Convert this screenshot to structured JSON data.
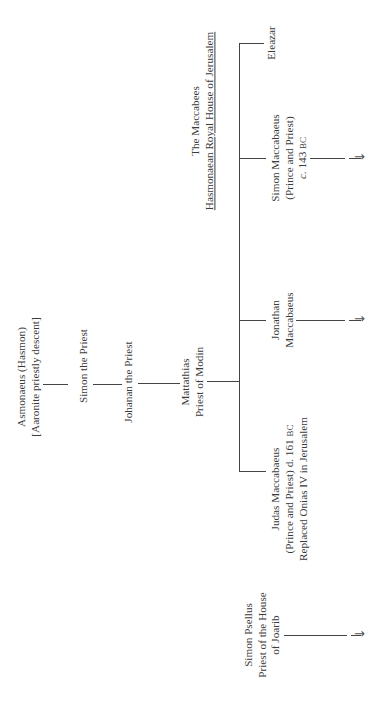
{
  "diagram": {
    "title": {
      "line1": "The Maccabees",
      "line2": "Hasmonaean Royal House of Jerusalem"
    },
    "nodes": {
      "asmonaeus": {
        "line1": "Asmonaeus (Hasmon)",
        "line2": "[Aaronite priestly descent]"
      },
      "simon_priest": {
        "line1": "Simon the Priest"
      },
      "johanan": {
        "line1": "Johanan the Priest"
      },
      "mattathias": {
        "line1": "Mattathias",
        "line2": "Priest  of Modin"
      },
      "judas": {
        "line1": "Judas Maccabaeus",
        "line2a": "(Prince and Priest) d. 161 ",
        "line2b": "BC",
        "line3": "Replaced Onias IV in Jerusalem"
      },
      "jonathan": {
        "line1": "Jonathan",
        "line2": "Maccabaeus"
      },
      "simon_maccabaeus": {
        "line1": "Simon Maccabaeus",
        "line2": "(Prince and Priest)",
        "line3a": "c.",
        "line3b": " 143 ",
        "line3c": "BC"
      },
      "eleazar": {
        "line1": "Eleazar"
      },
      "simon_psellus": {
        "line1": "Simon Psellus",
        "line2": "Priest of the House",
        "line3": "of Joarib"
      }
    },
    "arrow_glyph": "→",
    "orientation": "rotated 90° counter-clockwise"
  }
}
